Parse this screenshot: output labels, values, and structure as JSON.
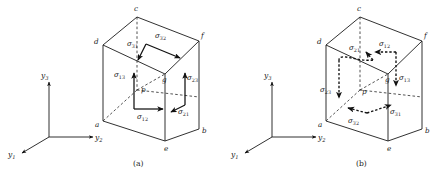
{
  "figure": {
    "background_color": "#ffffff",
    "line_color": "#1a1a1a"
  },
  "panels": [
    {
      "id": "a",
      "caption": "(a)",
      "description": "Cube with stress components on visible (front/top/right) faces drawn as solid arrows",
      "point_label": "p",
      "vertex_labels": {
        "a": "a",
        "b": "b",
        "c": "c",
        "d": "d",
        "e": "e",
        "f": "f",
        "g": "g"
      },
      "axes": {
        "y1": "y",
        "y1_sub": "1",
        "y2": "y",
        "y2_sub": "2",
        "y3": "y",
        "y3_sub": "3"
      },
      "stresses": [
        {
          "symbol": "σ",
          "sub": "31",
          "name": "sigma-31"
        },
        {
          "symbol": "σ",
          "sub": "32",
          "name": "sigma-32"
        },
        {
          "symbol": "σ",
          "sub": "13",
          "name": "sigma-13"
        },
        {
          "symbol": "σ",
          "sub": "23",
          "name": "sigma-23"
        },
        {
          "symbol": "σ",
          "sub": "12",
          "name": "sigma-12"
        },
        {
          "symbol": "σ",
          "sub": "21",
          "name": "sigma-21"
        }
      ]
    },
    {
      "id": "b",
      "caption": "(b)",
      "description": "Cube with stress components on hidden (back/bottom/left) faces drawn as dashed arrows",
      "point_label": "p",
      "vertex_labels": {
        "a": "a",
        "b": "b",
        "c": "c",
        "d": "d",
        "e": "e",
        "f": "f",
        "g": "g"
      },
      "axes": {
        "y1": "y",
        "y1_sub": "1",
        "y2": "y",
        "y2_sub": "2",
        "y3": "y",
        "y3_sub": "3"
      },
      "stresses": [
        {
          "symbol": "σ",
          "sub": "21",
          "name": "sigma-21"
        },
        {
          "symbol": "σ",
          "sub": "12",
          "name": "sigma-12"
        },
        {
          "symbol": "σ",
          "sub": "13",
          "name": "sigma-13"
        },
        {
          "symbol": "σ",
          "sub": "23",
          "name": "sigma-23"
        },
        {
          "symbol": "σ",
          "sub": "32",
          "name": "sigma-32"
        },
        {
          "symbol": "σ",
          "sub": "31",
          "name": "sigma-31"
        }
      ]
    }
  ]
}
